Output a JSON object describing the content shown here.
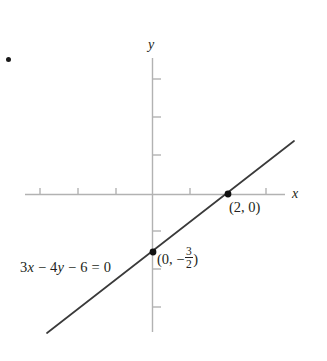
{
  "figure": {
    "width": 327,
    "height": 361,
    "background": "#ffffff",
    "artifact_dot": {
      "name": "bullet-mark",
      "x": 8,
      "y": 59
    }
  },
  "labels": {
    "y_axis": "y",
    "x_axis": "x",
    "equation_lhs": "3x − 4y − 6 = 0",
    "equation_parts": {
      "term1_coef": "3",
      "term1_var": "x",
      "op1": "−",
      "term2_coef": "4",
      "term2_var": "y",
      "op2": "−",
      "constant": "6",
      "equals": "=",
      "rhs": "0"
    },
    "y_intercept_label_open": "(0, −",
    "y_intercept_numerator": "3",
    "y_intercept_denominator": "2",
    "y_intercept_label_close": ")",
    "x_intercept_label": "(2, 0)"
  },
  "colors": {
    "axis": "#b2b2b2",
    "tick": "#b2b2b2",
    "line": "#3a3a3a",
    "point": "#111111",
    "text": "#231f20"
  },
  "chart_data": {
    "type": "line",
    "title": "",
    "xlabel": "x",
    "ylabel": "y",
    "equation": "3x - 4y - 6 = 0",
    "slope": 0.75,
    "y_intercept": -1.5,
    "x_intercept": 2,
    "grid": false,
    "legend": false,
    "xlim": [
      -3.35,
      3.5
    ],
    "ylim": [
      -3.63,
      3.58
    ],
    "x_ticks": [
      -3,
      -2,
      -1,
      1,
      2,
      3
    ],
    "y_ticks": [
      -3,
      -2,
      -1,
      1,
      2,
      3
    ],
    "tick_labels_shown": false,
    "series": [
      {
        "name": "3x - 4y - 6 = 0",
        "points": [
          {
            "x": -2.76,
            "y": -3.66
          },
          {
            "x": 3.74,
            "y": 1.39
          }
        ]
      }
    ],
    "annotated_points": [
      {
        "label": "(0, -3/2)",
        "x": 0,
        "y": -1.5
      },
      {
        "label": "(2, 0)",
        "x": 2,
        "y": 0
      }
    ],
    "annotations": [
      {
        "text": "3x - 4y - 6 = 0",
        "x": -2.6,
        "y": -2.05
      }
    ]
  },
  "geometry": {
    "origin": {
      "px": 152,
      "py": 194
    },
    "unit_px": 38,
    "x_axis": {
      "x1": 25,
      "x2": 285,
      "y": 194
    },
    "y_axis": {
      "x": 152,
      "y1": 58,
      "y2": 332
    },
    "x_tick_px": [
      40,
      78,
      116,
      190,
      266
    ],
    "y_tick_px": [
      79,
      117,
      155,
      231,
      269,
      307
    ],
    "line_px": {
      "x1": 47,
      "y1": 333,
      "x2": 294,
      "y2": 141
    },
    "points_px": [
      {
        "name": "y-intercept",
        "x": 153,
        "y": 252
      },
      {
        "name": "x-intercept",
        "x": 228,
        "y": 194
      }
    ]
  }
}
